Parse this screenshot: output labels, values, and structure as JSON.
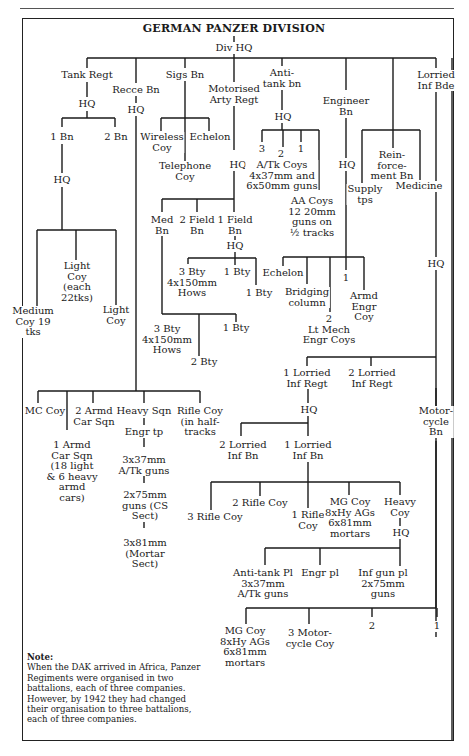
{
  "chart": {
    "title": "GERMAN PANZER DIVISION",
    "root": "Div HQ",
    "units": {
      "tank_regt": "Tank Regt",
      "tank_hq": "HQ",
      "tank_1bn": "1 Bn",
      "tank_2bn": "2 Bn",
      "tank_bn_hq": "HQ",
      "tank_light_coy_each": "Light\nCoy\n(each\n22tks)",
      "tank_medium_coy": "Medium\nCoy 19\ntks",
      "tank_light_coy": "Light\nCoy",
      "recce_bn": "Recce Bn",
      "recce_hq": "HQ",
      "recce_mc_coy": "MC Coy",
      "recce_1_armd_car": "1 Armd\nCar Sqn\n(18 light\n& 6 heavy\narmd\ncars)",
      "recce_2_armd_car": "2 Armd\nCar Sqn",
      "recce_heavy_sqn": "Heavy Sqn",
      "recce_engr_tp": "Engr tp",
      "recce_at_guns": "3x37mm\nA/Tk guns",
      "recce_cs_guns": "2x75mm\nguns (CS\nSect)",
      "recce_mortar": "3x81mm\n(Mortar\nSect)",
      "recce_rifle_coy": "Rifle Coy\n(in half-\ntracks",
      "sigs_bn": "Sigs Bn",
      "sigs_wireless": "Wireless\nCoy",
      "sigs_echelon": "Echelon",
      "sigs_telephone": "Telephone\nCoy",
      "arty_regt": "Motorised\nArty Regt",
      "arty_hq": "HQ",
      "arty_med_bn": "Med\nBn",
      "arty_2_field": "2 Field\nBn",
      "arty_1_field": "1 Field\nBn",
      "arty_field_hq": "HQ",
      "arty_field_3bty": "3 Bty\n4x150mm\nHows",
      "arty_field_1bty_a": "1 Bty",
      "arty_field_1bty_b": "1 Bty",
      "arty_med_3bty": "3 Bty\n4x150mm\nHows",
      "arty_med_2bty": "2 Bty",
      "arty_med_1bty": "1 Bty",
      "at_bn": "Anti-\ntank bn",
      "at_hq": "HQ",
      "at_3": "3",
      "at_2": "2",
      "at_1": "1",
      "at_coys": "A/Tk Coys\n4x37mm and\n6x50mm guns",
      "aa_coys": "AA Coys\n12 20mm\nguns on\n½ tracks",
      "engr_bn": "Engineer\nBn",
      "engr_hq": "HQ",
      "engr_echelon": "Echelon",
      "engr_bridging": "Bridging\ncolumn",
      "engr_2": "2\nLt Mech\nEngr Coys",
      "engr_1": "1",
      "engr_armd": "Armd\nEngr\nCoy",
      "supply_tps": "Supply\ntps",
      "reinf_bn": "Rein-\nforce-\nment Bn",
      "medicine": "Medicine",
      "inf_bde": "Lorried\nInf Bde",
      "inf_bde_hq": "HQ",
      "inf_1_regt": "1 Lorried\nInf Regt",
      "inf_2_regt": "2 Lorried\nInf Regt",
      "inf_regt_hq": "HQ",
      "inf_2_bn": "2 Lorried\nInf Bn",
      "inf_1_bn": "1 Lorried\nInf Bn",
      "inf_3_rifle": "3 Rifle Coy",
      "inf_2_rifle": "2 Rifle Coy",
      "inf_1_rifle": "1 Rifle\nCoy",
      "inf_mg_coy": "MG Coy\n8xHy AGs\n6x81mm\nmortars",
      "inf_heavy_coy": "Heavy\nCoy",
      "inf_heavy_hq": "HQ",
      "inf_at_pl": "Anti-tank Pl\n3x37mm\nA/Tk guns",
      "inf_engr_pl": "Engr pl",
      "inf_gun_pl": "Inf gun pl\n2x75mm\nguns",
      "moto_bn": "Motor-\ncycle\nBn",
      "moto_mg_coy": "MG Coy\n8xHy AGs\n6x81mm\nmortars",
      "moto_3_coy": "3 Motor-\ncycle Coy",
      "moto_2": "2",
      "moto_1": "1"
    },
    "note": {
      "heading": "Note:",
      "text": "When the DAK arrived in Africa, Panzer Regiments were organised in two battalions, each of three companies. However, by 1942 they had changed their organisation to three battalions, each of three companies."
    }
  }
}
